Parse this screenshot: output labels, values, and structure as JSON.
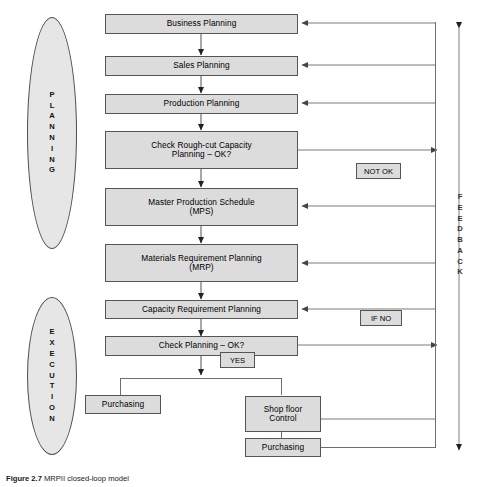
{
  "figure": {
    "caption_label": "Figure 2.7",
    "caption_text": "MRPII closed-loop model"
  },
  "phases": [
    {
      "name": "planning",
      "label": "PLANNING",
      "letters": [
        "P",
        "L",
        "A",
        "N",
        "N",
        "I",
        "N",
        "G"
      ]
    },
    {
      "name": "execution",
      "label": "EXECUTION",
      "letters": [
        "E",
        "X",
        "E",
        "C",
        "U",
        "T",
        "I",
        "O",
        "N"
      ]
    }
  ],
  "feedback": {
    "label": "FEEDBACK",
    "letters": [
      "F",
      "E",
      "E",
      "D",
      "B",
      "A",
      "C",
      "K"
    ]
  },
  "process_steps": [
    {
      "id": "business-planning",
      "label": "Business Planning"
    },
    {
      "id": "sales-planning",
      "label": "Sales Planning"
    },
    {
      "id": "production-planning",
      "label": "Production Planning"
    },
    {
      "id": "check-rough-cut",
      "label": "Check Rough-cut Capacity\nPlanning – OK?"
    },
    {
      "id": "mps",
      "label": "Master Production Schedule\n(MPS)"
    },
    {
      "id": "mrp",
      "label": "Materials Requirement Planning\n(MRP)"
    },
    {
      "id": "crp",
      "label": "Capacity Requirement Planning"
    },
    {
      "id": "check-planning",
      "label": "Check Planning – OK?"
    }
  ],
  "execution_steps": [
    {
      "id": "purchasing-left",
      "label": "Purchasing"
    },
    {
      "id": "shop-floor-control",
      "label": "Shop floor\nControl"
    },
    {
      "id": "purchasing-bottom",
      "label": "Purchasing"
    }
  ],
  "decision_tags": [
    {
      "id": "not-ok",
      "label": "NOT OK"
    },
    {
      "id": "if-no",
      "label": "IF NO"
    },
    {
      "id": "yes",
      "label": "YES"
    }
  ],
  "colors": {
    "box_fill": "#dcdcdc",
    "box_stroke": "#555555",
    "ellipse_fill": "#e6e6e6",
    "ellipse_stroke": "#4d4d4d",
    "connector": "#6e6e6e",
    "background": "#ffffff"
  }
}
